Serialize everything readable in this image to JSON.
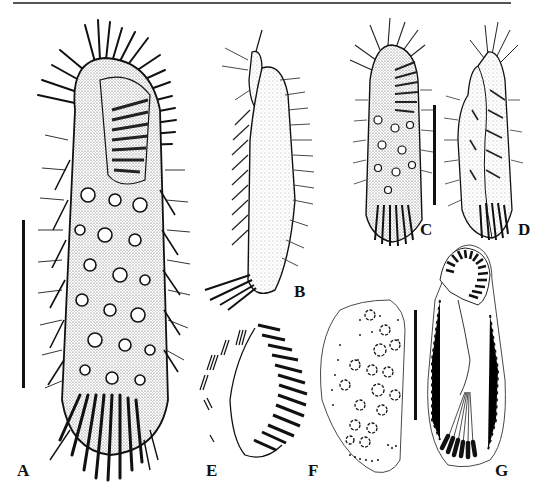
{
  "figure": {
    "panels": [
      {
        "id": "A",
        "label": "A",
        "description": "Ventral view of hypotrich ciliate with cirri, dorsal bristles and stippled cytoplasm"
      },
      {
        "id": "B",
        "label": "B",
        "description": "Lateral view, stippled body with bristles"
      },
      {
        "id": "C",
        "label": "C",
        "description": "Ventral view, smaller specimen"
      },
      {
        "id": "D",
        "label": "D",
        "description": "Lateral/dorsal view, smaller specimen"
      },
      {
        "id": "E",
        "label": "E",
        "description": "Oral apparatus detail with adoral membranelles"
      },
      {
        "id": "F",
        "label": "F",
        "description": "Dorsal infraciliature with nuclear apparatus"
      },
      {
        "id": "G",
        "label": "G",
        "description": "Ventral infraciliature with transverse cirri"
      }
    ],
    "scale_bars": [
      {
        "panel": "A",
        "x": 23,
        "y1": 220,
        "y2": 388
      },
      {
        "panel": "C-D",
        "x": 434,
        "y1": 105,
        "y2": 205
      },
      {
        "panel": "F-G",
        "x": 415,
        "y1": 310,
        "y2": 420
      }
    ]
  }
}
